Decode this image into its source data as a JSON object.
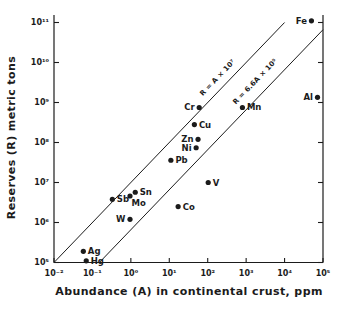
{
  "colors": {
    "background": "#ffffff",
    "ink": "#1b1b1b"
  },
  "chart_data": {
    "type": "scatter",
    "title": "",
    "xlabel": "Abundance (A) in continental crust, ppm",
    "ylabel": "Reserves (R) metric tons",
    "x_scale": "log",
    "y_scale": "log",
    "xlim": [
      0.01,
      100000
    ],
    "ylim": [
      100000,
      100000000000
    ],
    "grid": false,
    "x_ticks": {
      "values": [
        0.01,
        0.1,
        1,
        10,
        100,
        1000,
        10000,
        100000
      ],
      "labels": [
        "10⁻²",
        "10⁻¹",
        "10⁰",
        "10¹",
        "10²",
        "10³",
        "10⁴",
        "10⁵"
      ]
    },
    "y_ticks": {
      "values": [
        100000.0,
        1000000.0,
        10000000.0,
        100000000.0,
        1000000000.0,
        10000000000.0,
        100000000000.0
      ],
      "labels": [
        "10⁵",
        "10⁶",
        "10⁷",
        "10⁸",
        "10⁹",
        "10¹⁰",
        "10¹¹"
      ]
    },
    "points": [
      {
        "element": "Fe",
        "A": 50000,
        "R": 110000000000.0,
        "label_side": "left"
      },
      {
        "element": "Al",
        "A": 72000,
        "R": 1350000000.0,
        "label_side": "left"
      },
      {
        "element": "Mn",
        "A": 800,
        "R": 750000000.0,
        "label_side": "right"
      },
      {
        "element": "Cr",
        "A": 60,
        "R": 750000000.0,
        "label_side": "left"
      },
      {
        "element": "Cu",
        "A": 45,
        "R": 280000000.0,
        "label_side": "right"
      },
      {
        "element": "Zn",
        "A": 56,
        "R": 120000000.0,
        "label_side": "left"
      },
      {
        "element": "Ni",
        "A": 50,
        "R": 74000000.0,
        "label_side": "left"
      },
      {
        "element": "Pb",
        "A": 11,
        "R": 36000000.0,
        "label_side": "right"
      },
      {
        "element": "V",
        "A": 103,
        "R": 10000000.0,
        "label_side": "right"
      },
      {
        "element": "Co",
        "A": 17,
        "R": 2500000.0,
        "label_side": "right"
      },
      {
        "element": "Sn",
        "A": 1.3,
        "R": 5700000.0,
        "label_side": "right"
      },
      {
        "element": "Mo",
        "A": 0.95,
        "R": 4600000.0,
        "label_side": "below"
      },
      {
        "element": "Sb",
        "A": 0.33,
        "R": 3800000.0,
        "label_side": "right"
      },
      {
        "element": "W",
        "A": 0.95,
        "R": 1200000.0,
        "label_side": "left"
      },
      {
        "element": "Ag",
        "A": 0.058,
        "R": 190000.0,
        "label_side": "right"
      },
      {
        "element": "Hg",
        "A": 0.069,
        "R": 110000.0,
        "label_side": "right"
      }
    ],
    "reference_lines": [
      {
        "label": "R = A × 10⁷",
        "slope_coefficient": 10000000.0,
        "label_A": 280,
        "label_offset": 8
      },
      {
        "label": "R = 6.6A × 10⁵",
        "slope_coefficient": 660000.0,
        "label_A": 3000,
        "label_offset": 11
      }
    ]
  }
}
